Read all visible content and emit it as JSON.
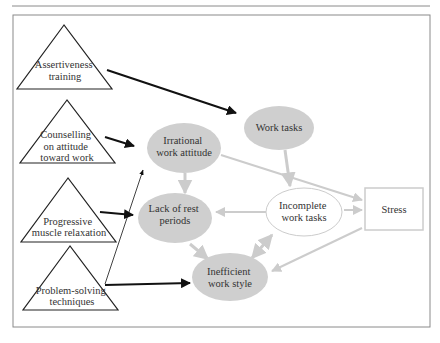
{
  "colors": {
    "node_fill": "#cfcfcf",
    "node_stroke": "#cfcfcf",
    "light_arrow": "#cccccc",
    "dark_arrow": "#111111",
    "frame": "#8a8a8a",
    "text": "#333333"
  },
  "interventions": [
    {
      "id": "assertiveness",
      "lines": [
        "Assertiveness",
        "training"
      ]
    },
    {
      "id": "counselling",
      "lines": [
        "Counselling",
        "on attitude",
        "toward work"
      ]
    },
    {
      "id": "progressive",
      "lines": [
        "Progressive",
        "muscle relaxation"
      ]
    },
    {
      "id": "problem-solving",
      "lines": [
        "Problem-solving",
        "techniques"
      ]
    }
  ],
  "factors": [
    {
      "id": "irrational",
      "lines": [
        "Irrational",
        "work attitude"
      ],
      "style": "filled"
    },
    {
      "id": "work-tasks",
      "lines": [
        "Work tasks"
      ],
      "style": "filled"
    },
    {
      "id": "lack-of-rest",
      "lines": [
        "Lack of rest",
        "periods"
      ],
      "style": "filled"
    },
    {
      "id": "incomplete",
      "lines": [
        "Incomplete",
        "work tasks"
      ],
      "style": "outline"
    },
    {
      "id": "inefficient",
      "lines": [
        "Inefficient",
        "work style"
      ],
      "style": "filled"
    }
  ],
  "outcome": {
    "id": "stress",
    "label": "Stress"
  },
  "edges": [
    {
      "from": "assertiveness",
      "to": "work-tasks",
      "type": "intervention"
    },
    {
      "from": "counselling",
      "to": "irrational",
      "type": "intervention"
    },
    {
      "from": "progressive",
      "to": "lack-of-rest",
      "type": "intervention"
    },
    {
      "from": "problem-solving",
      "to": "inefficient",
      "type": "intervention"
    },
    {
      "from": "problem-solving",
      "to": "irrational",
      "type": "intervention-thin"
    },
    {
      "from": "irrational",
      "to": "lack-of-rest",
      "type": "causal"
    },
    {
      "from": "irrational",
      "to": "stress",
      "type": "causal"
    },
    {
      "from": "work-tasks",
      "to": "incomplete",
      "type": "causal"
    },
    {
      "from": "lack-of-rest",
      "to": "inefficient",
      "type": "causal"
    },
    {
      "from": "incomplete",
      "to": "lack-of-rest",
      "type": "causal"
    },
    {
      "from": "inefficient",
      "to": "incomplete",
      "type": "causal-bidirectional"
    },
    {
      "from": "incomplete",
      "to": "stress",
      "type": "causal"
    },
    {
      "from": "stress",
      "to": "inefficient",
      "type": "causal"
    }
  ]
}
